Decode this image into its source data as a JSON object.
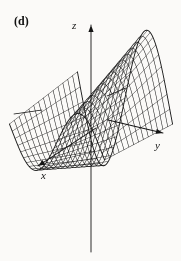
{
  "figure": {
    "panel_label": "(d)",
    "caption_visible": false,
    "background_color": "#fbfaf8",
    "ink_color": "#1a1a1a"
  },
  "axes": {
    "z": {
      "name": "z-axis",
      "label": "z",
      "label_position": {
        "x": 72,
        "y": 20
      },
      "direction": "up",
      "arrow": true,
      "start": {
        "x": 91,
        "y": 252
      },
      "end": {
        "x": 91,
        "y": 25
      }
    },
    "y": {
      "name": "y-axis",
      "label": "y",
      "label_position": {
        "x": 155,
        "y": 140
      },
      "direction": "right",
      "arrow": true,
      "start": {
        "x": 108,
        "y": 120
      },
      "end": {
        "x": 163,
        "y": 133
      }
    },
    "x": {
      "name": "x-axis",
      "label": "x",
      "label_position": {
        "x": 41,
        "y": 170
      },
      "direction": "down-left",
      "arrow": true,
      "start": {
        "x": 96,
        "y": 128
      },
      "end": {
        "x": 38,
        "y": 166
      }
    },
    "y_negative_stub": {
      "name": "negative-y-stub",
      "label": "",
      "arrow": false,
      "start": {
        "x": 42,
        "y": 110
      },
      "end": {
        "x": 14,
        "y": 114
      }
    },
    "y_positive_stub": {
      "name": "positive-y-stub",
      "label": "",
      "arrow": false,
      "start": {
        "x": 107,
        "y": 96
      },
      "end": {
        "x": 126,
        "y": 88
      }
    }
  },
  "chart_data": {
    "type": "surface",
    "title": "",
    "subtitle": "",
    "xlabel": "x",
    "ylabel": "y",
    "zlabel": "z",
    "render_style": "wireframe-mesh",
    "grid": false,
    "legend": null,
    "annotations": [
      "(d)"
    ],
    "surface_equation": "z = sin(y) * exp(-0.15*x)  (wave/saddle sheet)",
    "u_label": "y",
    "v_label": "x",
    "u_range": [
      -3.35,
      3.35
    ],
    "u_steps": 34,
    "v_range": [
      -1.0,
      1.0
    ],
    "v_steps": 14,
    "zlim": [
      -1.25,
      1.25
    ],
    "projection": {
      "type": "oblique-axonometric",
      "origin_px": {
        "x": 91,
        "y": 120
      },
      "u_axis_px": {
        "dx": 14.2,
        "dy": 3.3
      },
      "v_axis_px": {
        "dx": -34.0,
        "dy": 22.0
      },
      "z_axis_px": {
        "dx": 0.0,
        "dy": -54.0
      }
    },
    "amplitude_profile": {
      "description": "wave amplitude grows toward the near (-x) edge and is modulated along y",
      "near_edge_scale": 1.35,
      "far_edge_scale": 0.62
    },
    "line_weights": {
      "u_curves": 0.55,
      "v_curves": 0.5,
      "silhouette": 0.9
    },
    "sample_profile_u": [
      -3.35,
      -2.68,
      -2.01,
      -1.34,
      -0.67,
      0.0,
      0.67,
      1.34,
      2.01,
      2.68,
      3.35
    ],
    "sample_profile_z": [
      -0.2,
      -0.92,
      -1.0,
      -0.55,
      0.2,
      0.85,
      1.0,
      0.6,
      -0.12,
      -0.8,
      -1.0
    ]
  }
}
